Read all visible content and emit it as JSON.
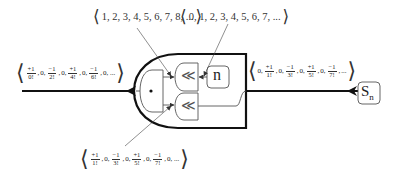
{
  "diagram": {
    "type": "stream-circuit",
    "components": {
      "n_source": {
        "label": "n",
        "icon": "n-generator-box"
      },
      "sn_source": {
        "label": "S",
        "subscript": "n",
        "icon": "stream-source-box"
      },
      "shift_top": {
        "glyph": "≪",
        "icon": "shift-left-gate"
      },
      "shift_bottom": {
        "glyph": "≪",
        "icon": "shift-left-gate"
      },
      "multiply": {
        "glyph": "•",
        "icon": "multiply-gate"
      }
    },
    "sequences": {
      "top_left": {
        "open": "⟨",
        "close": "⟩",
        "text": "1, 2, 3, 4, 5, 6, 7, 8, ..."
      },
      "top_right": {
        "open": "⟨",
        "close": "⟩",
        "text": "0, 1, 2, 3, 4, 5, 6, 7, ..."
      },
      "output": {
        "open": "⟨",
        "close": "⟩",
        "terms": [
          {
            "num": "+1",
            "den": "0!"
          },
          {
            "plain": "0,"
          },
          {
            "num": "−1",
            "den": "2!"
          },
          {
            "plain": "0,"
          },
          {
            "num": "+1",
            "den": "4!"
          },
          {
            "plain": "0,"
          },
          {
            "num": "−1",
            "den": "6!"
          },
          {
            "plain": "0, ..."
          }
        ]
      },
      "input": {
        "open": "⟨",
        "close": "⟩",
        "terms": [
          {
            "plain": "0,"
          },
          {
            "num": "+1",
            "den": "1!"
          },
          {
            "plain": "0,"
          },
          {
            "num": "−1",
            "den": "3!"
          },
          {
            "plain": "0,"
          },
          {
            "num": "+1",
            "den": "5!"
          },
          {
            "plain": "0,"
          },
          {
            "num": "−1",
            "den": "7!"
          },
          {
            "plain": "..."
          }
        ]
      },
      "bottom": {
        "open": "⟨",
        "close": "⟩",
        "terms": [
          {
            "num": "+1",
            "den": "1!"
          },
          {
            "plain": "0,"
          },
          {
            "num": "−1",
            "den": "3!"
          },
          {
            "plain": "0,"
          },
          {
            "num": "+1",
            "den": "5!"
          },
          {
            "plain": "0,"
          },
          {
            "num": "−1",
            "den": "7!"
          },
          {
            "plain": "0, ..."
          }
        ]
      }
    },
    "colors": {
      "stroke": "#111111",
      "thin": "#555555",
      "bg": "#ffffff"
    }
  }
}
